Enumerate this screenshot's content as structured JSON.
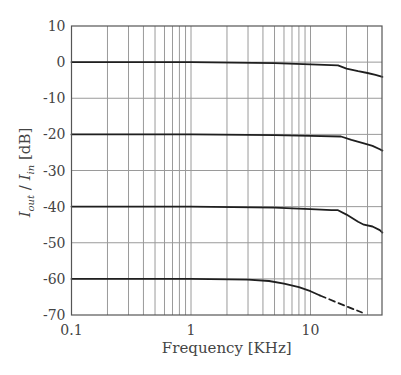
{
  "chart_data": {
    "type": "line",
    "title": "",
    "xlabel": "Frequency [KHz]",
    "ylabel": {
      "main": "I",
      "sub_out": "out",
      "slash": " / ",
      "main2": "I",
      "sub_in": "in",
      "unit": " [dB]"
    },
    "xscale": "log",
    "xlim": [
      0.1,
      40
    ],
    "ylim": [
      -70,
      10
    ],
    "grid": true,
    "legend": null,
    "x_tick_labels": [
      {
        "value": 0.1,
        "label": "0.1"
      },
      {
        "value": 1,
        "label": "1"
      },
      {
        "value": 10,
        "label": "10"
      }
    ],
    "y_ticks": [
      10,
      0,
      -10,
      -20,
      -30,
      -40,
      -50,
      -60,
      -70
    ],
    "y_tick_labels": [
      "10",
      "0",
      "-10",
      "-20",
      "-30",
      "-40",
      "-50",
      "-60",
      "-70"
    ],
    "x_minor_grid": [
      0.2,
      0.3,
      0.4,
      0.5,
      0.6,
      0.7,
      0.8,
      0.9,
      1,
      2,
      3,
      4,
      5,
      6,
      7,
      8,
      9,
      10,
      20,
      30
    ],
    "series": [
      {
        "name": "0 dB curve",
        "style": "solid",
        "x": [
          0.1,
          1,
          5,
          10,
          17,
          20,
          25,
          30,
          35,
          40
        ],
        "y": [
          0,
          0,
          -0.3,
          -0.6,
          -0.9,
          -1.8,
          -2.5,
          -3.0,
          -3.5,
          -4.1
        ]
      },
      {
        "name": "-20 dB curve",
        "style": "solid",
        "x": [
          0.1,
          1,
          5,
          10,
          18,
          22,
          28,
          33,
          38,
          40
        ],
        "y": [
          -20,
          -20,
          -20.2,
          -20.4,
          -20.6,
          -21.5,
          -22.5,
          -23.2,
          -24.1,
          -24.5
        ]
      },
      {
        "name": "-40 dB curve",
        "style": "solid",
        "x": [
          0.1,
          1,
          5,
          10,
          15,
          17,
          20,
          25,
          28,
          33,
          38,
          40
        ],
        "y": [
          -40,
          -40,
          -40.3,
          -40.7,
          -41,
          -41,
          -42.2,
          -44.2,
          -45,
          -45.5,
          -46.5,
          -47.2
        ]
      },
      {
        "name": "-60 dB curve",
        "style": "solid",
        "x": [
          0.1,
          1,
          3,
          4.5,
          6,
          8,
          10,
          12
        ],
        "y": [
          -60,
          -60,
          -60.2,
          -60.6,
          -61.3,
          -62.3,
          -63.4,
          -64.6
        ]
      },
      {
        "name": "-60 dB extrapolation",
        "style": "dashed",
        "x": [
          12,
          16,
          20,
          27
        ],
        "y": [
          -64.6,
          -66.3,
          -67.6,
          -69.3
        ]
      }
    ],
    "colors": {
      "curve": "#1f1f1f",
      "grid": "#9a9a9a",
      "frame": "#555555",
      "text": "#444444"
    }
  }
}
